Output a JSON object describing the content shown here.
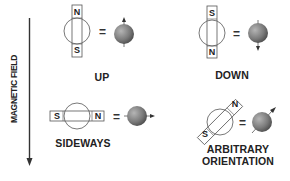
{
  "axis": {
    "label": "MAGNETIC FIELD",
    "direction": "down"
  },
  "colors": {
    "line": "#333333",
    "sphere_light": "#a8a8a8",
    "sphere_dark": "#4a4a4a",
    "text": "#222222"
  },
  "panels": [
    {
      "id": "up",
      "label": "UP",
      "magnet_top": "N",
      "magnet_bottom": "S",
      "equals": "=",
      "spin": "up"
    },
    {
      "id": "down",
      "label": "DOWN",
      "magnet_top": "S",
      "magnet_bottom": "N",
      "equals": "=",
      "spin": "down"
    },
    {
      "id": "sideways",
      "label": "SIDEWAYS",
      "magnet_left": "S",
      "magnet_right": "N",
      "equals": "=",
      "spin": "right"
    },
    {
      "id": "arbitrary",
      "label_line1": "ARBITRARY",
      "label_line2": "ORIENTATION",
      "magnet_upper": "N",
      "magnet_lower": "S",
      "equals": "=",
      "spin": "diagonal"
    }
  ]
}
